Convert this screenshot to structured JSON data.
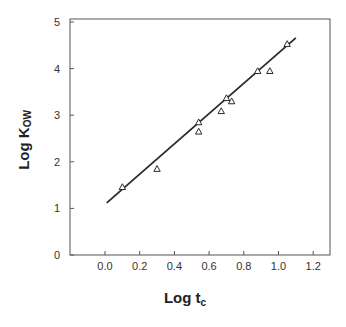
{
  "chart_data": {
    "type": "scatter",
    "title": "",
    "xlabel": "Log t_c",
    "xlabel_main": "Log t",
    "xlabel_sub": "c",
    "ylabel": "Log K_OW",
    "ylabel_main": "Log K",
    "ylabel_sub": "OW",
    "xlim": [
      -0.2,
      1.32
    ],
    "ylim": [
      0,
      5
    ],
    "x_ticks": [
      0.0,
      0.2,
      0.4,
      0.6,
      0.8,
      1.0,
      1.2
    ],
    "x_tick_labels": [
      "0.0",
      "0.2",
      "0.4",
      "0.6",
      "0.8",
      "1.0",
      "1.2"
    ],
    "y_ticks": [
      0,
      1,
      2,
      3,
      4,
      5
    ],
    "y_tick_labels": [
      "0",
      "1",
      "2",
      "3",
      "4",
      "5"
    ],
    "grid": false,
    "legend": null,
    "marker": "open-triangle",
    "series": [
      {
        "name": "data",
        "points": [
          {
            "x": 0.1,
            "y": 1.46
          },
          {
            "x": 0.3,
            "y": 1.85
          },
          {
            "x": 0.54,
            "y": 2.85
          },
          {
            "x": 0.54,
            "y": 2.65
          },
          {
            "x": 0.67,
            "y": 3.09
          },
          {
            "x": 0.7,
            "y": 3.37
          },
          {
            "x": 0.73,
            "y": 3.3
          },
          {
            "x": 0.88,
            "y": 3.95
          },
          {
            "x": 0.95,
            "y": 3.95
          },
          {
            "x": 1.05,
            "y": 4.53
          }
        ]
      }
    ],
    "fit_line": {
      "x": [
        0.01,
        1.1
      ],
      "y": [
        1.12,
        4.66
      ]
    }
  },
  "colors": {
    "ink": "#2a2a2a",
    "frame": "#555555",
    "background": "#ffffff"
  }
}
